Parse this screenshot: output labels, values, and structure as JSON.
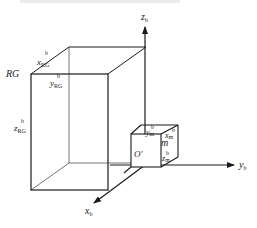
{
  "figure": {
    "type": "coordinate-frame-diagram",
    "axes": {
      "z": {
        "base": "z",
        "sub": "b"
      },
      "y": {
        "base": "y",
        "sub": "b"
      },
      "x": {
        "base": "x",
        "sub": "b"
      }
    },
    "large_box": {
      "name": "RG",
      "x_label": {
        "base": "x",
        "sub": "RG",
        "sup": "b"
      },
      "y_label": {
        "base": "y",
        "sub": "RG",
        "sup": "b"
      },
      "z_label": {
        "base": "z",
        "sub": "RG",
        "sup": "b"
      }
    },
    "small_box": {
      "name": "m",
      "origin": "O′",
      "x_label": {
        "base": "x",
        "sub": "m",
        "sup": "b"
      },
      "y_label": {
        "base": "y",
        "sub": "m",
        "sup": "b"
      },
      "z_label": {
        "base": "z",
        "sub": "m",
        "sup": "b"
      }
    },
    "colors": {
      "line": "#1a1a1a",
      "background": "#ffffff"
    }
  }
}
